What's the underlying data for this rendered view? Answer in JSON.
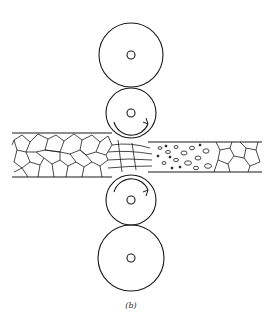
{
  "figure": {
    "label": "(b)",
    "colors": {
      "stroke": "#1a1a1a",
      "background": "#ffffff"
    },
    "components": [
      {
        "name": "top-backup-roll"
      },
      {
        "name": "top-work-roll",
        "rotation": "clockwise"
      },
      {
        "name": "bottom-work-roll",
        "rotation": "counterclockwise"
      },
      {
        "name": "bottom-backup-roll"
      },
      {
        "name": "strip",
        "zones": [
          "equiaxed-grains",
          "deformed-grains",
          "recrystallizing-grains",
          "new-grains"
        ]
      }
    ]
  }
}
